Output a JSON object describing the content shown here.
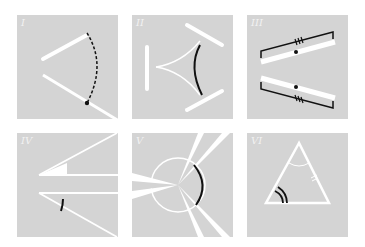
{
  "figure": {
    "panels": [
      {
        "id": "I",
        "label": "I",
        "description": "angle with dashed arc and vertex dot"
      },
      {
        "id": "II",
        "label": "II",
        "description": "curved triangle with three bars and black arc"
      },
      {
        "id": "III",
        "label": "III",
        "description": "two bars with brackets and triple tick marks"
      },
      {
        "id": "IV",
        "label": "IV",
        "description": "two angles with lines, one marked with arc"
      },
      {
        "id": "V",
        "label": "V",
        "description": "circle with radiating wedges, black arc"
      },
      {
        "id": "VI",
        "label": "VI",
        "description": "triangle with double arc angle mark and tick marks"
      }
    ]
  },
  "colors": {
    "panel_bg": "#d4d4d4",
    "line": "#ffffff",
    "mark": "#111111"
  }
}
